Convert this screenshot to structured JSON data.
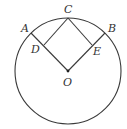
{
  "diagram": {
    "type": "geometry",
    "colors": {
      "stroke": "#3a3a3a",
      "text": "#333333",
      "background": "#ffffff"
    },
    "circle": {
      "center": "O",
      "cx": 68,
      "cy": 71,
      "r": 53
    },
    "points": {
      "A": {
        "label": "A",
        "x": 31,
        "y": 33
      },
      "B": {
        "label": "B",
        "x": 105,
        "y": 33
      },
      "C": {
        "label": "C",
        "x": 68,
        "y": 18
      },
      "D": {
        "label": "D",
        "x": 44,
        "y": 45
      },
      "E": {
        "label": "E",
        "x": 92,
        "y": 45
      },
      "O": {
        "label": "O",
        "x": 68,
        "y": 71
      }
    },
    "segments": [
      [
        "O",
        "A"
      ],
      [
        "O",
        "B"
      ],
      [
        "C",
        "D"
      ],
      [
        "C",
        "E"
      ]
    ]
  }
}
